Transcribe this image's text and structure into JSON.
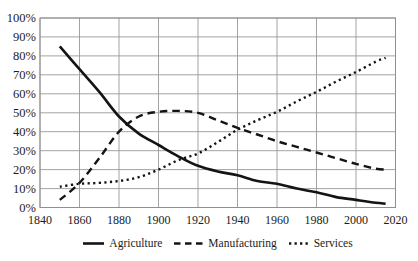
{
  "chart_data": {
    "type": "line",
    "x_years": [
      1850,
      1860,
      1870,
      1880,
      1890,
      1900,
      1910,
      1920,
      1930,
      1940,
      1950,
      1960,
      1970,
      1980,
      1990,
      2000,
      2010,
      2015
    ],
    "series": [
      {
        "name": "Agriculture",
        "line_style": "solid",
        "values": [
          85,
          73,
          61,
          48,
          39,
          33,
          27,
          22,
          19,
          17,
          14,
          12.5,
          10,
          8,
          5.5,
          4,
          2.5,
          2
        ]
      },
      {
        "name": "Manufacturing",
        "line_style": "dashed",
        "values": [
          4,
          13,
          26,
          40,
          48,
          50.5,
          51,
          50,
          46,
          42,
          38.5,
          35,
          32,
          29,
          26,
          23,
          20.5,
          20
        ]
      },
      {
        "name": "Services",
        "line_style": "dotted",
        "values": [
          11,
          12.5,
          13,
          14,
          16,
          20,
          25,
          28.5,
          34.5,
          41,
          46,
          50.5,
          56,
          61,
          66.5,
          71.5,
          77,
          79
        ]
      }
    ],
    "x_axis": {
      "range": [
        1840,
        2020
      ],
      "tick_values": [
        1840,
        1860,
        1880,
        1900,
        1920,
        1940,
        1960,
        1980,
        2000,
        2020
      ],
      "tick_labels": [
        "1840",
        "1860",
        "1880",
        "1900",
        "1920",
        "1940",
        "1960",
        "1980",
        "2000",
        "2020"
      ]
    },
    "y_axis": {
      "range": [
        0,
        100
      ],
      "tick_values": [
        0,
        10,
        20,
        30,
        40,
        50,
        60,
        70,
        80,
        90,
        100
      ],
      "tick_labels": [
        "0%",
        "10%",
        "20%",
        "30%",
        "40%",
        "50%",
        "60%",
        "70%",
        "80%",
        "90%",
        "100%"
      ]
    },
    "grid": "on",
    "legend_position": "bottom-center",
    "colors": {
      "line": "#141414",
      "grid": "#999999",
      "border": "#8f8f8f",
      "text": "#1c1c1c",
      "background": "#ffffff"
    }
  }
}
